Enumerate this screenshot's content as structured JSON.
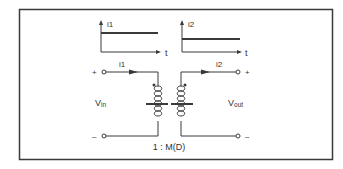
{
  "diagram": {
    "type": "ideal transformer model with time-domain currents",
    "colors": {
      "line": "#3a3a3a",
      "text": "#333333",
      "background": "#ffffff"
    },
    "waveform_primary": {
      "axis_label": "i1",
      "time_label": "t",
      "shape": "constant (DC)"
    },
    "waveform_secondary": {
      "axis_label": "i2",
      "time_label": "t",
      "shape": "constant (DC)"
    },
    "primary": {
      "current_label": "i1",
      "voltage_label": "V",
      "voltage_subscript": "in",
      "plus_label": "+",
      "minus_label": "–"
    },
    "secondary": {
      "current_label": "i2",
      "voltage_label": "V",
      "voltage_subscript": "out",
      "plus_label": "+",
      "minus_label": "–"
    },
    "turns_ratio": "1 : M(D)"
  }
}
